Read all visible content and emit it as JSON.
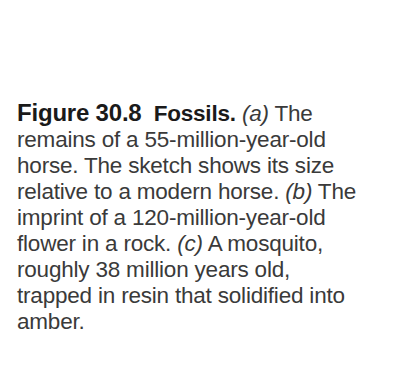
{
  "caption": {
    "figure_label": "Figure 30.8",
    "figure_title": "Fossils.",
    "lines": [
      {
        "pre": "",
        "label": "(a)",
        "post": " The"
      },
      {
        "pre": "remains of a 55-million-year-old",
        "label": "",
        "post": ""
      },
      {
        "pre": "horse. The sketch shows its size",
        "label": "",
        "post": ""
      },
      {
        "pre": "relative to a modern horse. ",
        "label": "(b)",
        "post": " The"
      },
      {
        "pre": "imprint of a 120-million-year-old",
        "label": "",
        "post": ""
      },
      {
        "pre": "flower in a rock. ",
        "label": "(c)",
        "post": " A mosquito,"
      },
      {
        "pre": "roughly 38 million years old,",
        "label": "",
        "post": ""
      },
      {
        "pre": "trapped in resin that solidified into",
        "label": "",
        "post": ""
      },
      {
        "pre": "amber.",
        "label": "",
        "post": ""
      }
    ]
  }
}
